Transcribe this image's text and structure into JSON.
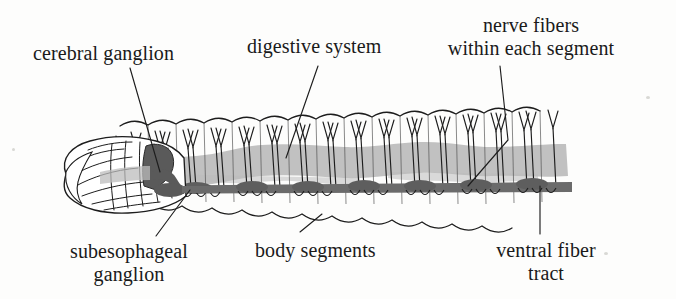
{
  "figure": {
    "background_color": "#fdfdfc",
    "ink_color": "#1a1a1a"
  },
  "labels": {
    "cerebral_ganglion": "cerebral ganglion",
    "digestive_system": "digestive system",
    "nerve_fibers_line1": "nerve fibers",
    "nerve_fibers_line2": "within each segment",
    "subesophageal_line1": "subesophageal",
    "subesophageal_line2": "ganglion",
    "body_segments": "body segments",
    "ventral_line1": "ventral fiber",
    "ventral_line2": "tract"
  },
  "anatomy": {
    "digestive_tract": {
      "name": "digestive system",
      "fill": "#bcbcbc",
      "description": "light gray undulating band running the length of the body"
    },
    "ventral_nerve_cord": {
      "name": "ventral fiber tract",
      "fill": "#6b6b6b",
      "description": "dark gray horizontal cord with segmental ganglion swellings"
    },
    "cerebral_ganglion": {
      "name": "cerebral ganglion",
      "fill": "#5a5a5a",
      "description": "dark bulb in the head above the esophagus"
    },
    "subesophageal_ganglion": {
      "name": "subesophageal ganglion",
      "fill": "#5a5a5a",
      "description": "dark mass below the esophagus connecting to the ventral cord"
    },
    "segment_count": 17,
    "nerve_fiber_pairs_per_segment": 2
  }
}
